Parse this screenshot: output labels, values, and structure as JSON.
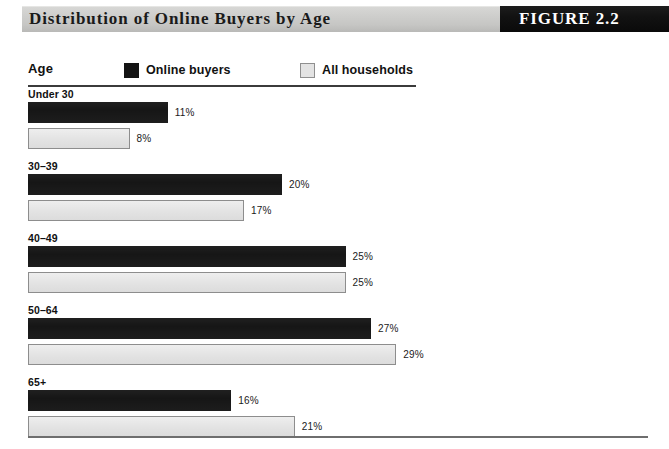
{
  "header": {
    "title": "Distribution of Online Buyers by Age",
    "figure_label": "FIGURE 2.2"
  },
  "legend": {
    "age_label": "Age",
    "entries": [
      {
        "label": "Online buyers",
        "swatch": "dark-square-icon",
        "color": "#161616"
      },
      {
        "label": "All households",
        "swatch": "light-square-icon",
        "color": "#e4e4e4"
      }
    ]
  },
  "chart_data": {
    "type": "bar",
    "orientation": "horizontal",
    "title": "Distribution of Online Buyers by Age",
    "xlabel": "",
    "ylabel": "Age",
    "xlim": [
      0,
      30
    ],
    "grid": false,
    "legend_position": "top",
    "value_suffix": "%",
    "px_per_unit": 12.7,
    "categories": [
      "Under 30",
      "30–39",
      "40–49",
      "50–64",
      "65+"
    ],
    "series": [
      {
        "name": "Online buyers",
        "color": "#161616",
        "values": [
          11,
          20,
          25,
          27,
          16
        ],
        "labels": [
          "11%",
          "20%",
          "25%",
          "27%",
          "16%"
        ]
      },
      {
        "name": "All households",
        "color": "#e4e4e4",
        "values": [
          8,
          17,
          25,
          29,
          21
        ],
        "labels": [
          "8%",
          "17%",
          "25%",
          "29%",
          "21%"
        ]
      }
    ]
  }
}
